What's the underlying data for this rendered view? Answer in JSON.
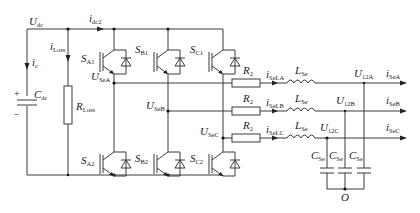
{
  "diagram": {
    "type": "circuit-schematic",
    "dc_side": {
      "voltage": {
        "main": "U",
        "sub": "dc"
      },
      "current_top": {
        "main": "i",
        "sub": "dc2"
      },
      "cap_current": {
        "main": "i",
        "sub": "c"
      },
      "loss_current": {
        "main": "i",
        "sub": "Loss"
      },
      "capacitor": {
        "main": "C",
        "sub": "dc"
      },
      "resistor": {
        "main": "R",
        "sub": "Loss"
      },
      "plus": "+",
      "minus": "−"
    },
    "switches": [
      {
        "id": "SA1",
        "main": "S",
        "sub": "A1"
      },
      {
        "id": "SB1",
        "main": "S",
        "sub": "B1"
      },
      {
        "id": "SC1",
        "main": "S",
        "sub": "C1"
      },
      {
        "id": "SA2",
        "main": "S",
        "sub": "A2"
      },
      {
        "id": "SB2",
        "main": "S",
        "sub": "B2"
      },
      {
        "id": "SC2",
        "main": "S",
        "sub": "C2"
      }
    ],
    "phase_nodes": [
      {
        "main": "U",
        "sub": "SeA"
      },
      {
        "main": "U",
        "sub": "SeB"
      },
      {
        "main": "U",
        "sub": "SeC"
      }
    ],
    "phases": [
      {
        "R": {
          "main": "R",
          "sub": "2"
        },
        "iL": {
          "main": "i",
          "sub": "SeLA"
        },
        "L": {
          "main": "L",
          "sub": "Se"
        },
        "U": {
          "main": "U",
          "sub": "12A"
        },
        "iout": {
          "main": "i",
          "sub": "SeA"
        }
      },
      {
        "R": {
          "main": "R",
          "sub": "2"
        },
        "iL": {
          "main": "i",
          "sub": "SeLB"
        },
        "L": {
          "main": "L",
          "sub": "Se"
        },
        "U": {
          "main": "U",
          "sub": "12B"
        },
        "iout": {
          "main": "i",
          "sub": "SeB"
        }
      },
      {
        "R": {
          "main": "R",
          "sub": "2"
        },
        "iL": {
          "main": "i",
          "sub": "SeLC"
        },
        "L": {
          "main": "L",
          "sub": "Se"
        },
        "U": {
          "main": "U",
          "sub": "12C"
        },
        "iout": {
          "main": "i",
          "sub": "SeC"
        }
      }
    ],
    "filter_caps": [
      {
        "main": "C",
        "sub": "Se"
      },
      {
        "main": "C",
        "sub": "Se"
      },
      {
        "main": "C",
        "sub": "Se"
      }
    ],
    "neutral": "O",
    "colors": {
      "wire": "#3a3a3a",
      "text": "#222222",
      "background": "#ffffff"
    }
  }
}
